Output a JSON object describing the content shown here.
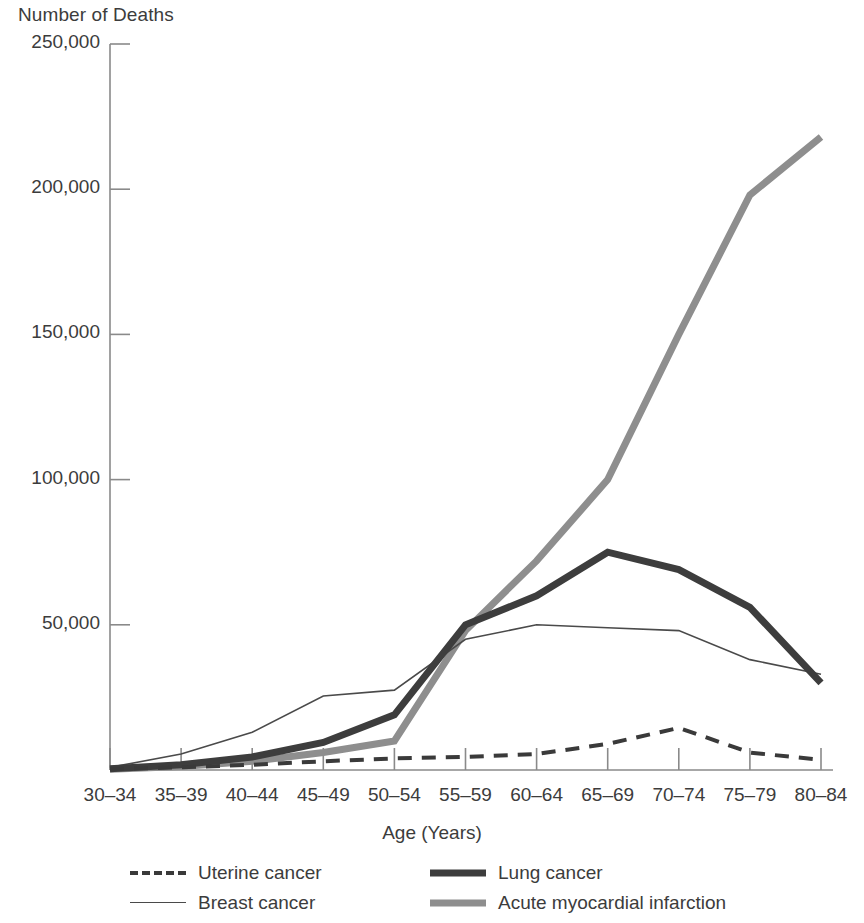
{
  "chart_data": {
    "type": "line",
    "title": "",
    "subtitle": "",
    "ylabel": "Number of Deaths",
    "xlabel": "Age (Years)",
    "categories": [
      "30-34",
      "35-39",
      "40-44",
      "45-49",
      "50-54",
      "55-59",
      "60-64",
      "65-69",
      "70-74",
      "75-79",
      "80-84"
    ],
    "x_tick_labels": [
      "30–34",
      "35–39",
      "40–44",
      "45–49",
      "50–54",
      "55–59",
      "60–64",
      "65–69",
      "70–74",
      "75–79",
      "80–84"
    ],
    "y_tick_labels": [
      "250,000",
      "200,000",
      "150,000",
      "100,000",
      "50,000"
    ],
    "y_tick_values": [
      250000,
      200000,
      150000,
      100000,
      50000
    ],
    "ylim": [
      0,
      250000
    ],
    "grid": false,
    "legend_position": "bottom",
    "series": [
      {
        "name": "Uterine cancer",
        "style": "dashed",
        "color": "#3a3a3a",
        "width": 4,
        "values": [
          300,
          900,
          1800,
          3000,
          4000,
          4500,
          5500,
          9000,
          14500,
          6000,
          3500
        ]
      },
      {
        "name": "Breast cancer",
        "style": "thin",
        "color": "#4a4a4a",
        "width": 1.6,
        "values": [
          900,
          5500,
          13000,
          25500,
          27500,
          45000,
          50000,
          49000,
          48000,
          38000,
          33000
        ]
      },
      {
        "name": "Lung cancer",
        "style": "thick",
        "color": "#3d3d3d",
        "width": 7,
        "values": [
          400,
          1800,
          4500,
          9500,
          19000,
          50000,
          60000,
          75000,
          69000,
          56000,
          30000
        ]
      },
      {
        "name": "Acute myocardial infarction",
        "style": "thick",
        "color": "#8e8e8e",
        "width": 7,
        "values": [
          300,
          1200,
          3000,
          6000,
          10000,
          48000,
          72000,
          100000,
          150000,
          198000,
          218000
        ]
      }
    ]
  }
}
